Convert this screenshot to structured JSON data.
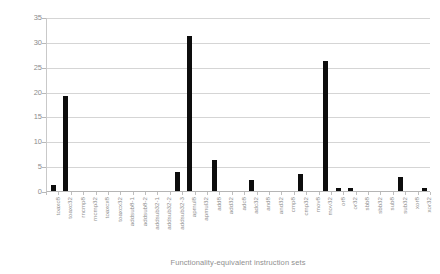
{
  "chart_data": {
    "type": "bar",
    "title": "",
    "xlabel": "Functionality-equivalent instruction sets",
    "ylabel": "Frequency in %",
    "ylim": [
      0,
      35
    ],
    "yticks": [
      0,
      5,
      10,
      15,
      20,
      25,
      30,
      35
    ],
    "grid": true,
    "legend": "none",
    "bar_color": "#0d0d0d",
    "categories": [
      "toaxc8",
      "toaxc32",
      "rncmp8",
      "rncmp32",
      "toaxcx8",
      "toaxcx32",
      "addsub8-1",
      "addsub8-2",
      "addsub32-1",
      "addsub32-2",
      "addsub32-3",
      "apmul8",
      "apmul32",
      "add8",
      "add32",
      "adc8",
      "adc32",
      "and8",
      "and32",
      "cmp8",
      "cmp32",
      "mov8",
      "mov32",
      "or8",
      "or32",
      "sbb8",
      "sbb32",
      "sub8",
      "sub32",
      "xor8",
      "xor32"
    ],
    "values": [
      1.2,
      19.2,
      0,
      0,
      0,
      0,
      0,
      0,
      0,
      0,
      3.9,
      31.1,
      0,
      6.3,
      0,
      0,
      2.2,
      0,
      0,
      0,
      3.4,
      0,
      26.2,
      0.6,
      0.7,
      0,
      0,
      0,
      2.9,
      0,
      0.6
    ]
  }
}
